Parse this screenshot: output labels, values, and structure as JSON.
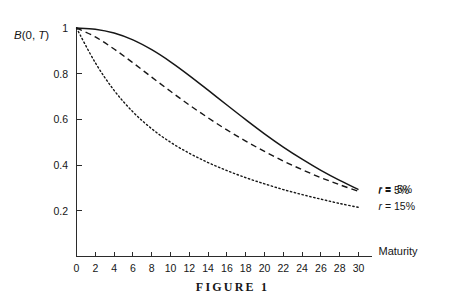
{
  "figure": {
    "caption": "FIGURE  1"
  },
  "axes": {
    "y_title_prefix": "B",
    "y_title_mid": "(0, ",
    "y_title_var": "T",
    "y_title_suffix": ")",
    "x_title": "Maturity",
    "x_ticks": [
      "0",
      "2",
      "4",
      "6",
      "8",
      "10",
      "12",
      "14",
      "16",
      "18",
      "20",
      "22",
      "24",
      "26",
      "28",
      "30"
    ],
    "y_ticks": [
      "0.2",
      "0.4",
      "0.6",
      "0.8",
      "1"
    ]
  },
  "legend": {
    "entries": [
      {
        "var": "r",
        "text": " = .5%"
      },
      {
        "var": "r",
        "text": " = 5%"
      },
      {
        "var": "r",
        "text": " = 15%"
      }
    ]
  },
  "chart_data": {
    "type": "line",
    "title": "FIGURE  1",
    "xlabel": "Maturity",
    "ylabel": "B(0, T)",
    "xlim": [
      0,
      30
    ],
    "ylim": [
      0,
      1
    ],
    "grid": false,
    "legend_position": "right-end-of-curves",
    "x": [
      0,
      2,
      4,
      6,
      8,
      10,
      12,
      14,
      16,
      18,
      20,
      22,
      24,
      26,
      28,
      30
    ],
    "series": [
      {
        "name": "r = .5%",
        "style": "solid",
        "values": [
          1.0,
          0.995,
          0.978,
          0.948,
          0.905,
          0.852,
          0.792,
          0.728,
          0.663,
          0.599,
          0.537,
          0.479,
          0.426,
          0.377,
          0.333,
          0.293
        ]
      },
      {
        "name": "r = 5%",
        "style": "dashed",
        "values": [
          1.0,
          0.961,
          0.908,
          0.848,
          0.785,
          0.723,
          0.663,
          0.607,
          0.554,
          0.505,
          0.46,
          0.418,
          0.38,
          0.345,
          0.314,
          0.285
        ]
      },
      {
        "name": "r = 15%",
        "style": "dotted",
        "values": [
          1.0,
          0.848,
          0.727,
          0.633,
          0.559,
          0.5,
          0.452,
          0.411,
          0.376,
          0.345,
          0.318,
          0.293,
          0.271,
          0.251,
          0.232,
          0.215
        ]
      }
    ]
  }
}
